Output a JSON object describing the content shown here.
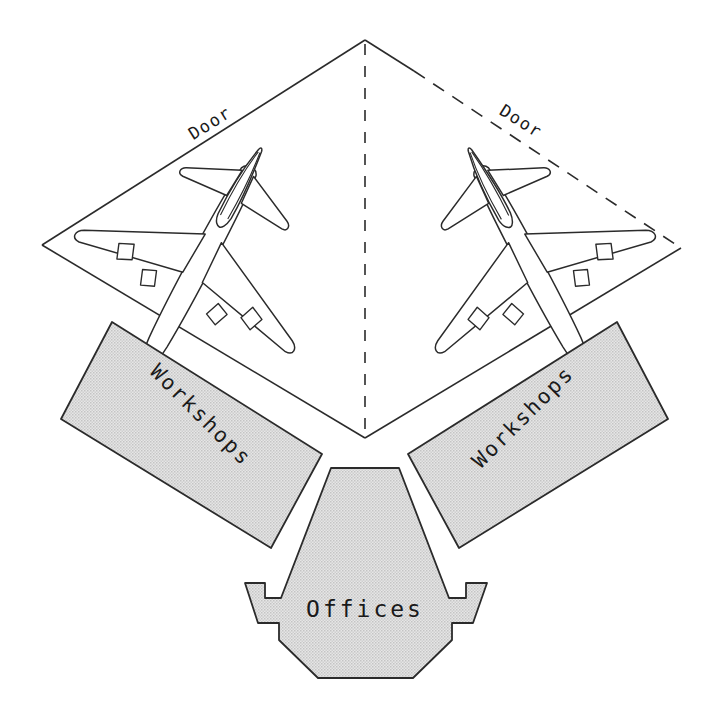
{
  "diagram": {
    "type": "architectural-plan",
    "background_color": "#ffffff",
    "line_color": "#2b2b2b",
    "fill_gray": "#dcdcdc",
    "fill_gray_dark": "#c9c9c9"
  },
  "apron": {
    "name": "hangar-apron-diamond",
    "apex": {
      "x": 365,
      "y": 40
    },
    "left_corner": {
      "x": 42,
      "y": 245
    },
    "right_corner": {
      "x": 681,
      "y": 248
    },
    "bottom_vertex": {
      "x": 365,
      "y": 438
    },
    "left_edge_style": "solid",
    "right_edge_style": "dashed",
    "center_line_style": "dashed"
  },
  "doors": [
    {
      "label": "Door",
      "side": "left",
      "rotation_deg": -32,
      "x": 213,
      "y": 128
    },
    {
      "label": "Door",
      "side": "right",
      "rotation_deg": 32,
      "x": 518,
      "y": 126
    }
  ],
  "aircraft": [
    {
      "name": "aircraft-left",
      "type": "wide-body-quad-jet",
      "engines": 4,
      "heading": "nose-down-right"
    },
    {
      "name": "aircraft-right",
      "type": "wide-body-quad-jet",
      "engines": 4,
      "heading": "nose-down-left"
    }
  ],
  "buildings": [
    {
      "id": "workshops-left",
      "label": "Workshops",
      "rotation_deg": 45,
      "label_x": 196,
      "label_y": 420,
      "fill": "#dcdcdc"
    },
    {
      "id": "workshops-right",
      "label": "Workshops",
      "rotation_deg": -45,
      "label_x": 528,
      "label_y": 422,
      "fill": "#dcdcdc"
    },
    {
      "id": "offices",
      "label": "Offices",
      "rotation_deg": 0,
      "label_x": 365,
      "label_y": 617,
      "fill": "#dcdcdc"
    }
  ]
}
